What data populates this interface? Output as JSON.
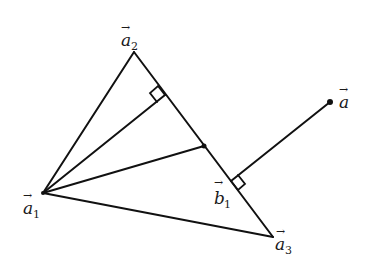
{
  "diagram": {
    "type": "geometry-triangle-projection",
    "stroke_color": "#111111",
    "background": "#ffffff",
    "points": {
      "a1": {
        "x": 43,
        "y": 193
      },
      "a2": {
        "x": 134,
        "y": 52
      },
      "a3": {
        "x": 273,
        "y": 237
      },
      "mid": {
        "x": 204,
        "y": 146
      },
      "foot_a1": {
        "x": 165,
        "y": 95
      },
      "b1": {
        "x": 231,
        "y": 181
      },
      "a": {
        "x": 330,
        "y": 102
      }
    },
    "labels": {
      "a2": {
        "base": "a",
        "sub": "2",
        "x": 121,
        "y": 46
      },
      "a1": {
        "base": "a",
        "sub": "1",
        "x": 23,
        "y": 214
      },
      "a3": {
        "base": "a",
        "sub": "3",
        "x": 275,
        "y": 250
      },
      "b1": {
        "base": "b",
        "sub": "1",
        "x": 214,
        "y": 204
      },
      "a": {
        "base": "a",
        "sub": "",
        "x": 339,
        "y": 108
      }
    },
    "vector_arrow": "→"
  }
}
